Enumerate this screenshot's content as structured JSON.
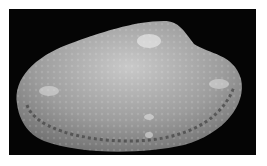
{
  "image": {
    "subject": "bivalve shell",
    "alt": "Gray bivalve clam shell with radial and concentric sculpture on a black background",
    "background_color": "#050505",
    "frame_color": "#ffffff",
    "shell_color": "#9a9a9a",
    "highlight_color": "#e8e8e8",
    "rim_color": "#4a4a4a"
  }
}
